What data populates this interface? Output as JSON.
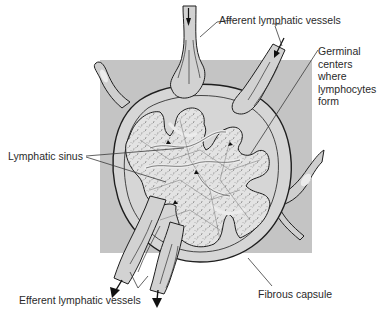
{
  "figure": {
    "colors": {
      "background_square": "#c4c4c4",
      "capsule_fill": "#d6d6d6",
      "tissue_fill": "#e4e4e4",
      "outline": "#1e1e1e",
      "label_text": "#2a2a2a",
      "leader_line": "#3a3a3a"
    }
  },
  "labels": {
    "afferent": "Afferent lymphatic vessels",
    "germinal": {
      "line1": "Germinal",
      "line2": "centers",
      "line3": "where",
      "line4": "lymphocytes",
      "line5": "form"
    },
    "sinus": "Lymphatic sinus",
    "efferent": "Efferent lymphatic vessels",
    "capsule": "Fibrous capsule"
  },
  "structures": [
    {
      "id": "afferent-vessel-top",
      "arrow": "down"
    },
    {
      "id": "afferent-vessel-right",
      "arrow": "down-left"
    },
    {
      "id": "efferent-vessel-left",
      "arrow": "down-left"
    },
    {
      "id": "efferent-vessel-right",
      "arrow": "down"
    },
    {
      "id": "blood-vessel-left"
    },
    {
      "id": "blood-vessel-right"
    },
    {
      "id": "fibrous-capsule"
    },
    {
      "id": "germinal-centers"
    },
    {
      "id": "lymphatic-sinus"
    }
  ]
}
